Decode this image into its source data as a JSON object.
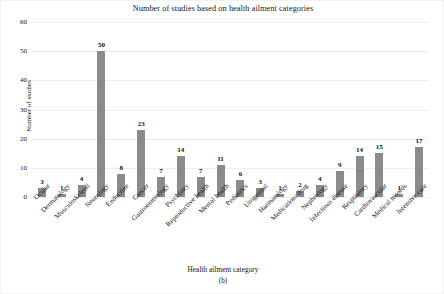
{
  "chart_data": {
    "type": "bar",
    "title": "Number of studies based on health ailment categories",
    "xlabel": "Health ailment category",
    "ylabel": "Number of studies",
    "caption": "(b)",
    "ylim": [
      0,
      60
    ],
    "yticks": [
      0,
      10,
      20,
      30,
      40,
      50,
      60
    ],
    "grid": true,
    "legend": null,
    "bar_color": "#8b8b8b",
    "categories": [
      "Ocular",
      "Dermatology",
      "Musculoskeletal",
      "Neurology",
      "Endocrine",
      "Cancer",
      "Gastroenterology",
      "Psychiatry",
      "Reproductive health",
      "Mental health",
      "Pediatrics",
      "Urogenital",
      "Haematology",
      "Medication/ drug",
      "Nephrology",
      "Infectious disease",
      "Respiratory",
      "Cardiovascular",
      "Medical records",
      "Intensive care"
    ],
    "values": [
      3,
      1,
      4,
      50,
      8,
      23,
      7,
      14,
      7,
      11,
      6,
      3,
      1,
      2,
      4,
      9,
      14,
      15,
      1,
      17
    ]
  }
}
